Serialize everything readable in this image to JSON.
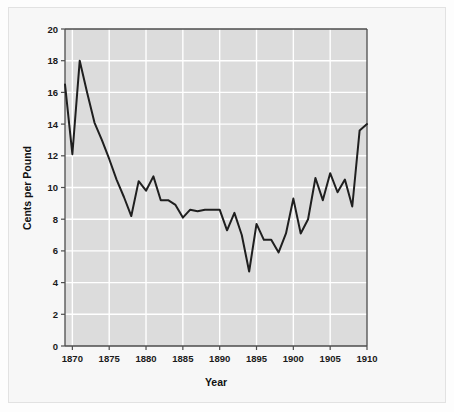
{
  "chart_data": {
    "type": "line",
    "title": "",
    "subtitle": "",
    "xlabel": "Year",
    "ylabel": "Cents per Pound",
    "xlim": [
      1869,
      1910
    ],
    "ylim": [
      0,
      20
    ],
    "xticks": [
      1870,
      1875,
      1880,
      1885,
      1890,
      1895,
      1900,
      1905,
      1910
    ],
    "xtick_labels": [
      "1870",
      "1875",
      "1880",
      "1885",
      "1890",
      "1895",
      "1900",
      "1905",
      "1910"
    ],
    "yticks": [
      0,
      2,
      4,
      6,
      8,
      10,
      12,
      14,
      16,
      18,
      20
    ],
    "ytick_labels": [
      "0",
      "2",
      "4",
      "6",
      "8",
      "10",
      "12",
      "14",
      "16",
      "18",
      "20"
    ],
    "grid": true,
    "grid_color": "#ffffff",
    "plot_bg_color": "#dcdcdc",
    "line_color": "#1f1f1f",
    "line_width": 2,
    "legend": null,
    "legend_position": "none",
    "annotations": [],
    "x": [
      1869,
      1870,
      1871,
      1872,
      1873,
      1874,
      1875,
      1876,
      1877,
      1878,
      1879,
      1880,
      1881,
      1882,
      1883,
      1884,
      1885,
      1886,
      1887,
      1888,
      1889,
      1890,
      1891,
      1892,
      1893,
      1894,
      1895,
      1896,
      1897,
      1898,
      1899,
      1900,
      1901,
      1902,
      1903,
      1904,
      1905,
      1906,
      1907,
      1908,
      1909,
      1910
    ],
    "values": [
      16.5,
      12.1,
      18.0,
      16.0,
      14.1,
      13.0,
      11.8,
      10.5,
      9.4,
      8.2,
      10.4,
      9.8,
      10.7,
      9.2,
      9.2,
      8.9,
      8.1,
      8.6,
      8.5,
      8.6,
      8.6,
      8.6,
      7.3,
      8.4,
      7.0,
      4.7,
      7.7,
      6.7,
      6.7,
      5.9,
      7.1,
      9.3,
      7.1,
      8.0,
      10.6,
      9.2,
      10.9,
      9.7,
      10.5,
      8.8,
      13.6,
      14.0
    ],
    "series": [
      {
        "name": "Cotton price",
        "values": [
          16.5,
          12.1,
          18.0,
          16.0,
          14.1,
          13.0,
          11.8,
          10.5,
          9.4,
          8.2,
          10.4,
          9.8,
          10.7,
          9.2,
          9.2,
          8.9,
          8.1,
          8.6,
          8.5,
          8.6,
          8.6,
          8.6,
          7.3,
          8.4,
          7.0,
          4.7,
          7.7,
          6.7,
          6.7,
          5.9,
          7.1,
          9.3,
          7.1,
          8.0,
          10.6,
          9.2,
          10.9,
          9.7,
          10.5,
          8.8,
          13.6,
          14.0
        ]
      }
    ]
  },
  "colors": {
    "page_background": "#fdfdfd",
    "panel_background": "#f7f7f7",
    "plot_background": "#dcdcdc",
    "grid": "#ffffff",
    "line": "#1f1f1f",
    "axis": "#555555",
    "text": "#111111"
  }
}
